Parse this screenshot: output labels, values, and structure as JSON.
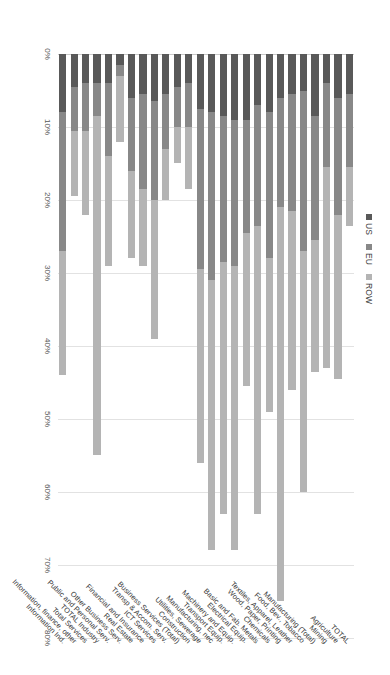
{
  "chart": {
    "type": "bar",
    "orientation": "horizontal-stacked",
    "title": "",
    "xlabel": "",
    "ylabel": "",
    "legend_position": "top-left",
    "grid": true
  },
  "legend": {
    "items": [
      {
        "label": "US",
        "color": "#595959"
      },
      {
        "label": "EU",
        "color": "#888888"
      },
      {
        "label": "ROW",
        "color": "#b4b4b4"
      }
    ]
  },
  "axis": {
    "ticks": [
      "0%",
      "10%",
      "20%",
      "30%",
      "40%",
      "50%",
      "60%",
      "70%",
      "80%"
    ],
    "tick_values": [
      0,
      10,
      20,
      30,
      40,
      50,
      60,
      70,
      80
    ],
    "min": 0,
    "max": 80
  },
  "chart_data": {
    "type": "bar",
    "title": "",
    "xlabel": "",
    "ylabel": "",
    "xlim": [
      0,
      80
    ],
    "grid": true,
    "legend_position": "top-left",
    "stacked": true,
    "categories": [
      "TOTAL",
      "Agriculture",
      "Mining",
      "Manufacturing (Total)",
      "Food, Bev., Tobacco",
      "Textiles, Apparel, Leather",
      "Wood, Paper, Printing",
      "Chemicals",
      "Basic and Fab. Metals",
      "Electrical Equip.",
      "Machinery and Equip.",
      "Transport Equip.",
      "Manufacturing, nec",
      "Utilities, Sewerage",
      "Construction",
      "Business Services (Total)",
      "Transp & Accom. Serv.",
      "ICT Services",
      "Financial and Insurance",
      "Real Estate",
      "Other Business Serv.",
      "Public and Personal Serv.",
      "TOTAL Industry",
      "Total Services",
      "Information, finance, other",
      "Information Ind."
    ],
    "series": [
      {
        "name": "US",
        "color": "#595959",
        "values": [
          5.5,
          6.0,
          4.0,
          8.5,
          5.0,
          5.5,
          6.0,
          8.0,
          7.0,
          9.0,
          9.0,
          8.5,
          8.0,
          7.5,
          4.0,
          4.5,
          5.5,
          6.5,
          5.5,
          6.0,
          1.5,
          4.0,
          4.0,
          4.0,
          4.5,
          8.0
        ]
      },
      {
        "name": "EU",
        "color": "#888888",
        "values": [
          10.0,
          16.0,
          11.5,
          17.0,
          22.0,
          16.0,
          15.0,
          20.0,
          16.5,
          15.5,
          20.0,
          20.0,
          23.0,
          22.0,
          6.0,
          5.5,
          7.5,
          13.5,
          13.0,
          10.0,
          1.5,
          10.0,
          4.5,
          6.5,
          6.0,
          19.0
        ]
      },
      {
        "name": "ROW",
        "color": "#b4b4b4",
        "values": [
          8.0,
          22.5,
          27.5,
          18.0,
          33.0,
          24.5,
          54.0,
          21.0,
          39.5,
          21.0,
          39.0,
          34.5,
          37.0,
          26.5,
          8.5,
          5.0,
          7.0,
          19.0,
          10.5,
          12.0,
          9.0,
          15.0,
          46.5,
          11.5,
          9.0,
          17.0
        ]
      }
    ],
    "totals": [
      23.5,
      44.5,
      43.0,
      43.5,
      60.0,
      46.0,
      75.0,
      49.0,
      63.0,
      45.5,
      68.0,
      63.0,
      68.0,
      56.0,
      18.5,
      15.0,
      20.0,
      39.0,
      29.0,
      28.0,
      12.0,
      29.0,
      55.0,
      22.0,
      19.5,
      44.0
    ]
  }
}
